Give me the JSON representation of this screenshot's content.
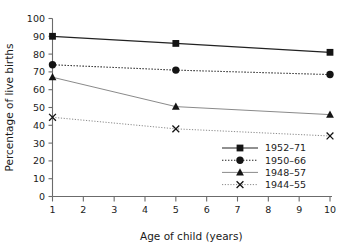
{
  "chart_data": {
    "type": "line",
    "title": "",
    "xlabel": "Age of child (years)",
    "ylabel": "Percentage of live births",
    "x": [
      1,
      5,
      10
    ],
    "xlim": [
      1,
      10
    ],
    "ylim": [
      0,
      100
    ],
    "xticks": [
      1,
      2,
      3,
      4,
      5,
      6,
      7,
      8,
      9,
      10
    ],
    "yticks": [
      0,
      10,
      20,
      30,
      40,
      50,
      60,
      70,
      80,
      90,
      100
    ],
    "grid": false,
    "legend_position": "inside lower-right",
    "series": [
      {
        "name": "1952–71",
        "values": [
          90,
          86,
          81
        ],
        "line_style": "solid",
        "color": "#222222",
        "marker": "square"
      },
      {
        "name": "1950–66",
        "values": [
          74,
          71,
          68.5
        ],
        "line_style": "dotted",
        "color": "#222222",
        "marker": "circle"
      },
      {
        "name": "1948–57",
        "values": [
          67,
          50.5,
          46
        ],
        "line_style": "solid",
        "color": "#8a8a8a",
        "marker": "triangle"
      },
      {
        "name": "1944–55",
        "values": [
          44.5,
          38,
          34
        ],
        "line_style": "dotted",
        "color": "#8a8a8a",
        "marker": "cross"
      }
    ]
  },
  "axes": {
    "y_tick_labels": [
      "0",
      "10",
      "20",
      "30",
      "40",
      "50",
      "60",
      "70",
      "80",
      "90",
      "100"
    ],
    "x_tick_labels": [
      "1",
      "2",
      "3",
      "4",
      "5",
      "6",
      "7",
      "8",
      "9",
      "10"
    ],
    "y_title": "Percentage of live births",
    "x_title": "Age of child (years)"
  },
  "legend": {
    "entries": [
      {
        "label": "1952–71"
      },
      {
        "label": "1950–66"
      },
      {
        "label": "1948–57"
      },
      {
        "label": "1944–55"
      }
    ]
  }
}
